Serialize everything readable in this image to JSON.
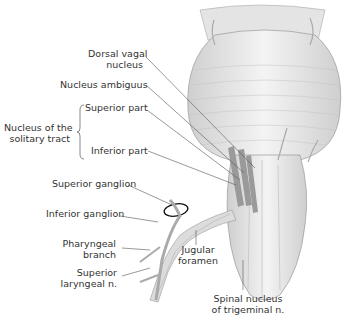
{
  "labels": {
    "dorsal_vagal": [
      "Dorsal vagal",
      "nucleus"
    ],
    "nucleus_ambiguus": "Nucleus ambiguus",
    "solitary_tract": [
      "Nucleus of the",
      "solitary tract"
    ],
    "superior_part": "Superior part",
    "inferior_part": "Inferior part",
    "superior_ganglion": "Superior ganglion",
    "inferior_ganglion": "Inferior ganglion",
    "pharyngeal": [
      "Pharyngeal",
      "branch"
    ],
    "superior_laryngeal": [
      "Superior",
      "laryngeal n."
    ],
    "jugular": [
      "Jugular",
      "foramen"
    ],
    "spinal_trigeminal": [
      "Spinal nucleus",
      "of trigeminal n."
    ]
  },
  "colors": {
    "text": "#333333",
    "leader": "#555555",
    "nucleus_fill": "#9a9a9a",
    "tissue": "#d8d8d8"
  }
}
